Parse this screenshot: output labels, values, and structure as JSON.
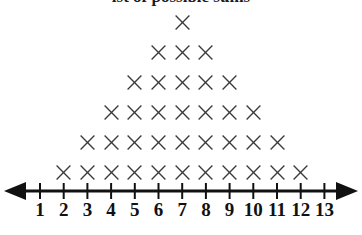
{
  "title": {
    "text": "ist of possible sums",
    "clipped": true
  },
  "colors": {
    "mark": "#3a3a3a",
    "axis": "#111111",
    "label": "#111111",
    "background": "#ffffff"
  },
  "axis": {
    "name": "number-line",
    "min_label": 1,
    "max_label": 13,
    "tick_labels": [
      "1",
      "2",
      "3",
      "4",
      "5",
      "6",
      "7",
      "8",
      "9",
      "10",
      "11",
      "12",
      "13"
    ],
    "left_arrow": true,
    "right_arrow": true
  },
  "chart_data": {
    "type": "scatter",
    "plot_style": "dot-plot",
    "marker": "X",
    "title": "ist of possible sums",
    "xlabel": "",
    "ylabel": "",
    "xlim": [
      1,
      13
    ],
    "grid": false,
    "legend": null,
    "total_marks": 36,
    "categories": [
      1,
      2,
      3,
      4,
      5,
      6,
      7,
      8,
      9,
      10,
      11,
      12,
      13
    ],
    "values": [
      0,
      1,
      2,
      3,
      4,
      5,
      6,
      5,
      4,
      3,
      2,
      1,
      0
    ],
    "stacks": [
      {
        "x": 1,
        "count": 0
      },
      {
        "x": 2,
        "count": 1
      },
      {
        "x": 3,
        "count": 2
      },
      {
        "x": 4,
        "count": 3
      },
      {
        "x": 5,
        "count": 4
      },
      {
        "x": 6,
        "count": 5
      },
      {
        "x": 7,
        "count": 6
      },
      {
        "x": 8,
        "count": 5
      },
      {
        "x": 9,
        "count": 4
      },
      {
        "x": 10,
        "count": 3
      },
      {
        "x": 11,
        "count": 2
      },
      {
        "x": 12,
        "count": 1
      },
      {
        "x": 13,
        "count": 0
      }
    ]
  }
}
